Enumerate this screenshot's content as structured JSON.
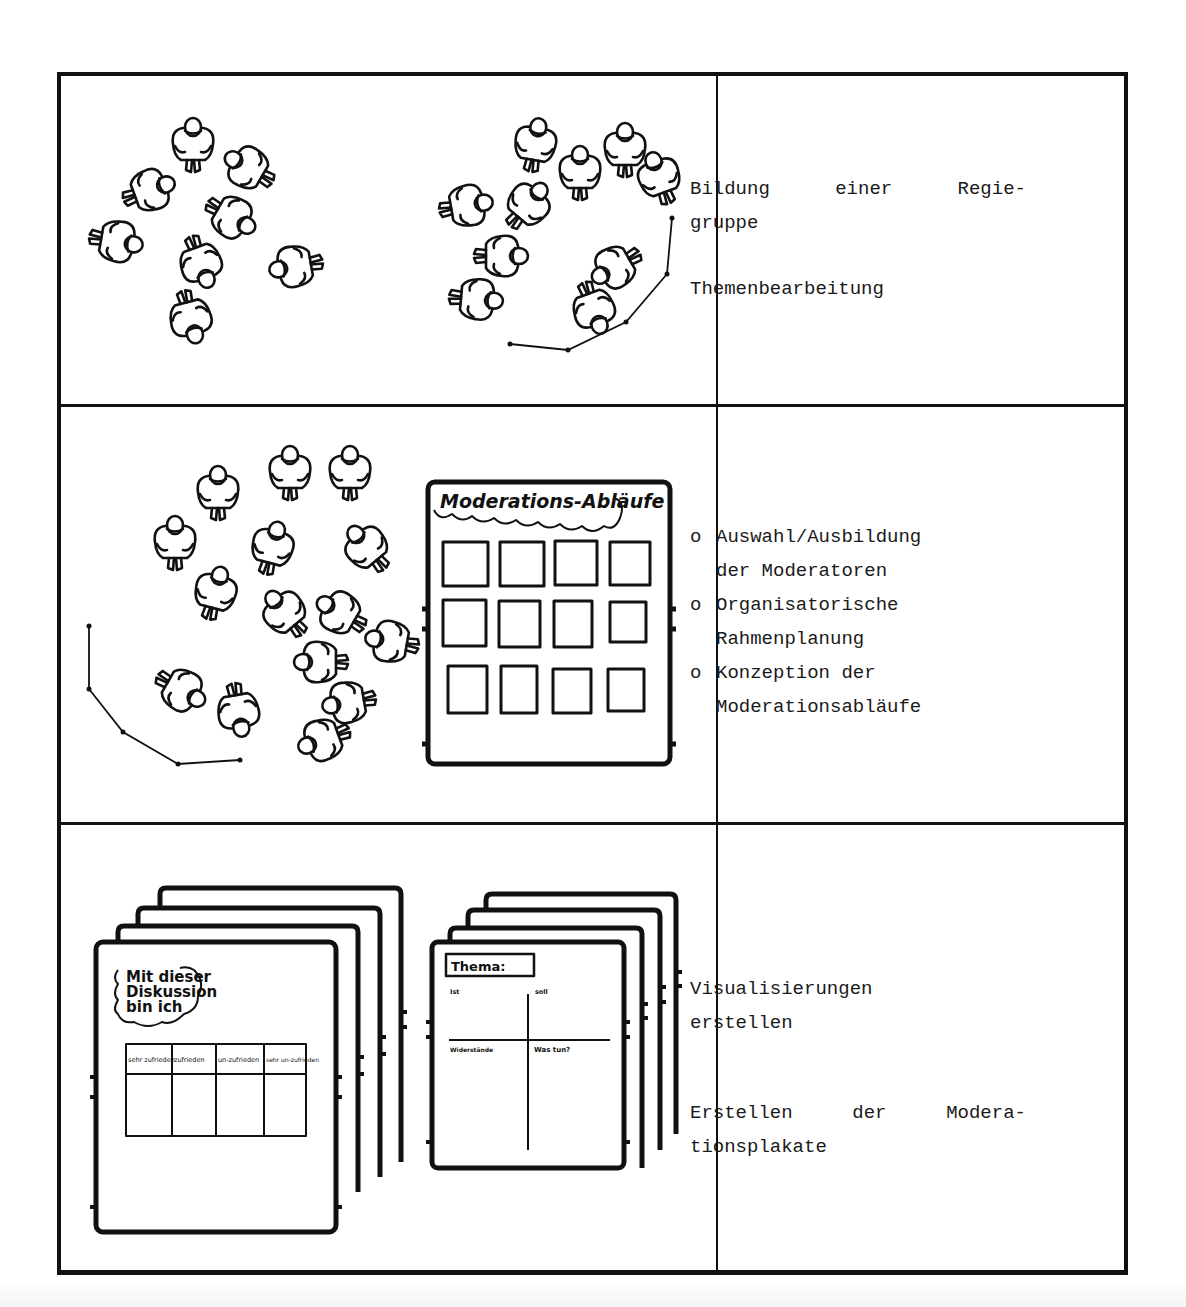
{
  "rows": [
    {
      "illustration": {
        "left_group_label": "people-group-scattered",
        "right_group_label": "people-group-with-moderator-path"
      },
      "text": {
        "line1_words": [
          "Bildung",
          "einer",
          "Regie-"
        ],
        "line2": "gruppe",
        "line3": "Themenbearbeitung"
      }
    },
    {
      "illustration": {
        "board_title": "Moderations-Abläufe",
        "card_rows": 3,
        "card_cols": 4
      },
      "text": {
        "bullet_mark": "o",
        "items": [
          {
            "line1": "Auswahl/Ausbildung",
            "line2": "der Moderatoren"
          },
          {
            "line1": "Organisatorische",
            "line2": "Rahmenplanung"
          },
          {
            "line1": "Konzeption der",
            "line2": "Moderationsabläufe"
          }
        ]
      }
    },
    {
      "illustration": {
        "poster1": {
          "cloud_text": [
            "Mit dieser",
            "Diskussion",
            "bin ich"
          ],
          "scale_headers": [
            "sehr zufrieden",
            "zufrieden",
            "un-zufrieden",
            "sehr un-zufrieden"
          ]
        },
        "poster2": {
          "title": "Thema:",
          "quadrants": [
            "Ist",
            "soll",
            "Widerstände",
            "Was tun?"
          ]
        }
      },
      "text": {
        "block1_line1": "Visualisierungen",
        "block1_line2": "erstellen",
        "block2_words": [
          "Erstellen",
          "der",
          "Modera-"
        ],
        "block2_line2": "tionsplakate"
      }
    }
  ]
}
